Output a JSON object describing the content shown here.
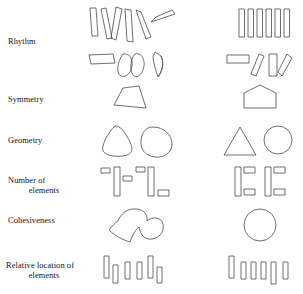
{
  "figure": {
    "background_color": "#ffffff",
    "stroke_color": "#4a4a4a",
    "text_color": "#111111",
    "column_count": 2,
    "row_count": 6
  },
  "rows": [
    {
      "id": "rhythm",
      "label_line1": "Rhythm",
      "label_line2": "",
      "left_description": "irregularly angled and varied bars and lobed shapes",
      "right_description": "evenly spaced parallel bars and regular tilted shapes"
    },
    {
      "id": "symmetry",
      "label_line1": "Symmetry",
      "label_line2": "",
      "left_description": "asymmetric trapezoid",
      "right_description": "symmetric pentagon"
    },
    {
      "id": "geometry",
      "label_line1": "Geometry",
      "label_line2": "",
      "left_description": "rounded organic triangle and rounded organic circle",
      "right_description": "exact triangle and exact circle"
    },
    {
      "id": "number-of-elements",
      "label_line1": "Number of",
      "label_line2": "elements",
      "left_description": "two tall bars with four scattered small bars",
      "right_description": "two groups of one tall bar with two small bars"
    },
    {
      "id": "cohesiveness",
      "label_line1": "Cohesiveness",
      "label_line2": "",
      "left_description": "irregular concave blob",
      "right_description": "single cohesive circle"
    },
    {
      "id": "relative-location-of-elements",
      "label_line1": "Relative location of",
      "label_line2": "elements",
      "left_description": "bars at scattered vertical offsets",
      "right_description": "bars aligned along a common baseline"
    }
  ]
}
